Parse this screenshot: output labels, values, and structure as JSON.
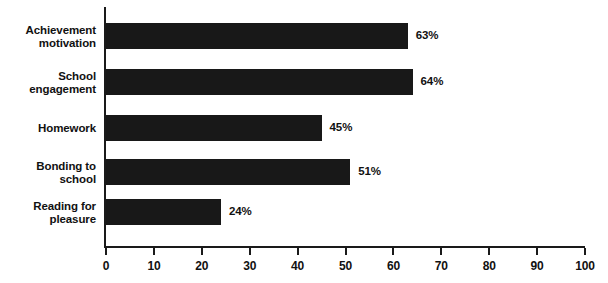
{
  "chart_data": {
    "type": "bar",
    "orientation": "horizontal",
    "title": "",
    "xlabel": "",
    "ylabel": "",
    "xlim": [
      0,
      100
    ],
    "xticks": [
      0,
      10,
      20,
      30,
      40,
      50,
      60,
      70,
      80,
      90,
      100
    ],
    "grid": false,
    "legend": false,
    "bar_color": "#181818",
    "axis_color": "#1a1a1a",
    "categories": [
      "Achievement motivation",
      "School engagement",
      "Homework",
      "Bonding to school",
      "Reading for pleasure"
    ],
    "values": [
      63,
      64,
      45,
      51,
      24
    ],
    "value_labels": [
      "63%",
      "64%",
      "45%",
      "51%",
      "24%"
    ],
    "category_label_lines": [
      [
        "Achievement",
        "motivation"
      ],
      [
        "School",
        "engagement"
      ],
      [
        "Homework"
      ],
      [
        "Bonding to",
        "school"
      ],
      [
        "Reading for",
        "pleasure"
      ]
    ],
    "tick_labels": [
      "0",
      "10",
      "20",
      "30",
      "40",
      "50",
      "60",
      "70",
      "80",
      "90",
      "100"
    ]
  }
}
